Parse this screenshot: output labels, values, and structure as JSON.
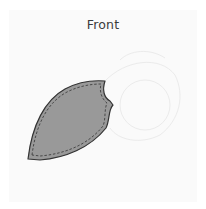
{
  "title": "Front",
  "diagram": {
    "piece_name": "front-panel-piece",
    "fill_color": "#999999",
    "outline_color": "#333333",
    "stitch_color": "#333333",
    "ghost_color": "#ececec",
    "background_color": "#fafafa"
  }
}
